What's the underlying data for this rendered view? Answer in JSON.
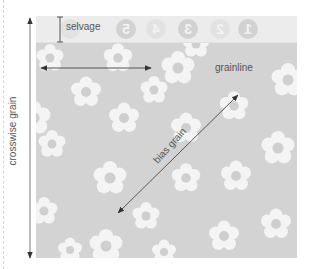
{
  "diagram": {
    "labels": {
      "selvage": "selvage",
      "grainline": "grainline",
      "crosswise_grain": "crosswise grain",
      "bias_grain": "bias grain"
    },
    "selvage_marks": [
      "5",
      "4",
      "3",
      "2",
      "1"
    ],
    "colors": {
      "fabric": "#d3d3d3",
      "selvage": "#ececec",
      "flower_petal": "#f4f4f4",
      "flower_center": "#cfcfcf",
      "arrow": "#555555",
      "label_text": "#555555"
    },
    "arrows": [
      {
        "name": "selvage",
        "type": "double-bar",
        "from": [
          59,
          17
        ],
        "to": [
          59,
          42
        ]
      },
      {
        "name": "grainline",
        "type": "double-arrow",
        "from": [
          40,
          68
        ],
        "to": [
          150,
          68
        ]
      },
      {
        "name": "crosswise grain",
        "type": "double-arrow",
        "from": [
          30,
          17
        ],
        "to": [
          30,
          258
        ]
      },
      {
        "name": "bias grain",
        "type": "double-arrow",
        "from": [
          238,
          95
        ],
        "to": [
          118,
          214
        ]
      }
    ]
  }
}
